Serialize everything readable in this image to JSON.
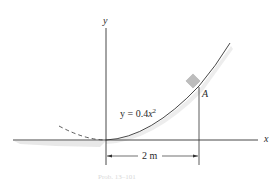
{
  "diagram": {
    "axes": {
      "x_label": "x",
      "y_label": "y"
    },
    "curve": {
      "equation_prefix": "y = 0.4",
      "equation_var": "x",
      "equation_exp": "2",
      "style": "solid",
      "extension_style": "dashed"
    },
    "point": {
      "label": "A",
      "marker": "block-on-curve"
    },
    "dimension": {
      "label": "2 m"
    },
    "caption": "Prob. 13–101"
  },
  "colors": {
    "line": "#333333",
    "block": "#bdbdbd",
    "shadow": "#d9d9d9"
  }
}
